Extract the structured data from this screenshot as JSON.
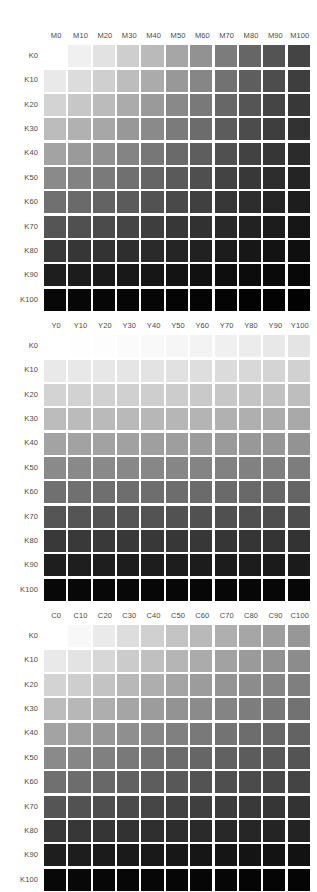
{
  "page": {
    "background_color": "#ffffff",
    "label_color": "#4a4a4a",
    "width": 317,
    "height": 887
  },
  "chart_data": [
    {
      "type": "heatmap",
      "title": "Magenta × Black tint chart",
      "xlabel": "Magenta tint (%)",
      "ylabel": "Black tint (%)",
      "grid": false,
      "legend": "none",
      "colorant": "M",
      "categories": [
        "M0",
        "M10",
        "M20",
        "M30",
        "M40",
        "M50",
        "M60",
        "M70",
        "M80",
        "M90",
        "M100"
      ],
      "row_labels": [
        "K0",
        "K10",
        "K20",
        "K30",
        "K40",
        "K50",
        "K60",
        "K70",
        "K80",
        "K90",
        "K100"
      ],
      "x": [
        0,
        10,
        20,
        30,
        40,
        50,
        60,
        70,
        80,
        90,
        100
      ],
      "y": [
        0,
        10,
        20,
        30,
        40,
        50,
        60,
        70,
        80,
        90,
        100
      ],
      "values": [
        [
          255,
          240,
          226,
          206,
          186,
          166,
          146,
          124,
          102,
          84,
          68
        ],
        [
          233,
          220,
          207,
          189,
          171,
          152,
          134,
          114,
          94,
          77,
          62
        ],
        [
          211,
          199,
          187,
          171,
          154,
          137,
          121,
          103,
          85,
          69,
          56
        ],
        [
          188,
          177,
          167,
          152,
          138,
          123,
          108,
          92,
          76,
          62,
          50
        ],
        [
          163,
          154,
          145,
          132,
          119,
          106,
          94,
          80,
          66,
          54,
          43
        ],
        [
          138,
          130,
          122,
          112,
          101,
          90,
          79,
          67,
          56,
          45,
          36
        ],
        [
          112,
          106,
          99,
          91,
          82,
          73,
          64,
          55,
          45,
          37,
          29
        ],
        [
          85,
          80,
          75,
          69,
          62,
          55,
          49,
          41,
          34,
          28,
          22
        ],
        [
          57,
          54,
          51,
          46,
          42,
          37,
          33,
          28,
          23,
          19,
          15
        ],
        [
          30,
          28,
          26,
          24,
          22,
          19,
          17,
          14,
          12,
          10,
          8
        ],
        [
          8,
          7,
          7,
          6,
          6,
          5,
          5,
          4,
          3,
          3,
          2
        ]
      ]
    },
    {
      "type": "heatmap",
      "title": "Yellow × Black tint chart",
      "xlabel": "Yellow tint (%)",
      "ylabel": "Black tint (%)",
      "grid": false,
      "legend": "none",
      "colorant": "Y",
      "categories": [
        "Y0",
        "Y10",
        "Y20",
        "Y30",
        "Y40",
        "Y50",
        "Y60",
        "Y70",
        "Y80",
        "Y90",
        "Y100"
      ],
      "row_labels": [
        "K0",
        "K10",
        "K20",
        "K30",
        "K40",
        "K50",
        "K60",
        "K70",
        "K80",
        "K90",
        "K100"
      ],
      "x": [
        0,
        10,
        20,
        30,
        40,
        50,
        60,
        70,
        80,
        90,
        100
      ],
      "y": [
        0,
        10,
        20,
        30,
        40,
        50,
        60,
        70,
        80,
        90,
        100
      ],
      "values": [
        [
          255,
          254,
          253,
          251,
          249,
          246,
          243,
          240,
          236,
          232,
          228
        ],
        [
          233,
          232,
          231,
          229,
          227,
          225,
          222,
          219,
          216,
          212,
          209
        ],
        [
          211,
          210,
          209,
          208,
          206,
          204,
          201,
          199,
          196,
          193,
          190
        ],
        [
          188,
          187,
          186,
          185,
          183,
          182,
          180,
          177,
          175,
          172,
          169
        ],
        [
          163,
          162,
          162,
          161,
          159,
          158,
          156,
          154,
          152,
          150,
          147
        ],
        [
          138,
          137,
          137,
          136,
          135,
          134,
          132,
          130,
          129,
          127,
          125
        ],
        [
          112,
          112,
          111,
          110,
          110,
          109,
          107,
          106,
          105,
          103,
          101
        ],
        [
          85,
          85,
          84,
          84,
          83,
          82,
          81,
          80,
          79,
          78,
          77
        ],
        [
          57,
          57,
          57,
          56,
          56,
          55,
          55,
          54,
          53,
          52,
          51
        ],
        [
          30,
          30,
          30,
          29,
          29,
          29,
          28,
          28,
          28,
          27,
          27
        ],
        [
          8,
          8,
          8,
          8,
          7,
          7,
          7,
          7,
          7,
          7,
          7
        ]
      ]
    },
    {
      "type": "heatmap",
      "title": "Cyan × Black tint chart",
      "xlabel": "Cyan tint (%)",
      "ylabel": "Black tint (%)",
      "grid": false,
      "legend": "none",
      "colorant": "C",
      "categories": [
        "C0",
        "C10",
        "C20",
        "C30",
        "C40",
        "C50",
        "C60",
        "C70",
        "C80",
        "C90",
        "C100"
      ],
      "row_labels": [
        "K0",
        "K10",
        "K20",
        "K30",
        "K40",
        "K50",
        "K60",
        "K70",
        "K80",
        "K90",
        "K100"
      ],
      "x": [
        0,
        10,
        20,
        30,
        40,
        50,
        60,
        70,
        80,
        90,
        100
      ],
      "y": [
        0,
        10,
        20,
        30,
        40,
        50,
        60,
        70,
        80,
        90,
        100
      ],
      "values": [
        [
          255,
          248,
          234,
          221,
          208,
          196,
          185,
          175,
          166,
          158,
          151
        ],
        [
          233,
          227,
          215,
          203,
          192,
          181,
          171,
          162,
          154,
          146,
          140
        ],
        [
          211,
          206,
          195,
          184,
          174,
          165,
          156,
          148,
          140,
          133,
          127
        ],
        [
          188,
          183,
          174,
          165,
          156,
          147,
          139,
          132,
          125,
          119,
          114
        ],
        [
          163,
          159,
          151,
          143,
          135,
          128,
          121,
          115,
          109,
          103,
          99
        ],
        [
          138,
          134,
          128,
          121,
          114,
          108,
          102,
          97,
          92,
          88,
          84
        ],
        [
          112,
          109,
          104,
          98,
          93,
          88,
          83,
          79,
          75,
          71,
          68
        ],
        [
          85,
          82,
          78,
          74,
          70,
          66,
          63,
          60,
          57,
          54,
          51
        ],
        [
          57,
          55,
          53,
          50,
          47,
          45,
          42,
          40,
          38,
          36,
          35
        ],
        [
          30,
          29,
          27,
          26,
          25,
          23,
          22,
          21,
          20,
          19,
          18
        ],
        [
          8,
          8,
          7,
          7,
          7,
          6,
          6,
          6,
          5,
          5,
          5
        ]
      ]
    }
  ],
  "layout": {
    "blocks": [
      {
        "name": "magenta-chart",
        "top": 28
      },
      {
        "name": "yellow-chart",
        "top": 318
      },
      {
        "name": "cyan-chart",
        "top": 608
      }
    ],
    "grid_left": 44,
    "cell_pitch": 24.36,
    "patch_size": 22.2
  }
}
